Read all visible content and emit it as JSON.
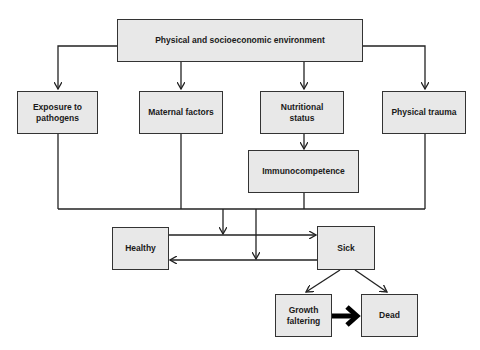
{
  "diagram": {
    "nodes": {
      "environment": "Physical and socioeconomic environment",
      "exposure": "Exposure to pathogens",
      "maternal": "Maternal factors",
      "nutritional": "Nutritional status",
      "trauma": "Physical trauma",
      "immuno": "Immunocompetence",
      "healthy": "Healthy",
      "sick": "Sick",
      "growth": "Growth faltering",
      "dead": "Dead"
    },
    "edges": [
      {
        "from": "Physical and socioeconomic environment",
        "to": "Exposure to pathogens"
      },
      {
        "from": "Physical and socioeconomic environment",
        "to": "Maternal factors"
      },
      {
        "from": "Physical and socioeconomic environment",
        "to": "Nutritional status"
      },
      {
        "from": "Physical and socioeconomic environment",
        "to": "Physical trauma"
      },
      {
        "from": "Nutritional status",
        "to": "Immunocompetence"
      },
      {
        "from": "Exposure to pathogens, Maternal factors, Immunocompetence, Physical trauma",
        "to": "Healthy→Sick transition"
      },
      {
        "from": "Exposure to pathogens, Maternal factors, Immunocompetence, Physical trauma",
        "to": "Sick→Healthy transition"
      },
      {
        "from": "Healthy",
        "to": "Sick"
      },
      {
        "from": "Sick",
        "to": "Healthy"
      },
      {
        "from": "Sick",
        "to": "Growth faltering"
      },
      {
        "from": "Sick",
        "to": "Dead"
      },
      {
        "from": "Growth faltering",
        "to": "Dead",
        "style": "thick"
      }
    ]
  }
}
